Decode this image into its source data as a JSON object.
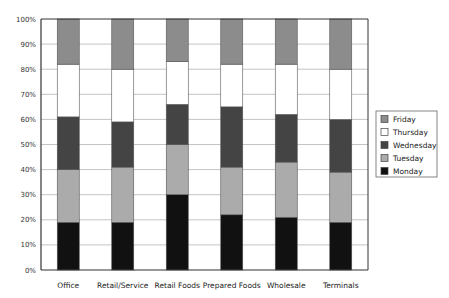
{
  "chart_data": {
    "type": "bar",
    "stacked": true,
    "percent": true,
    "title": "",
    "xlabel": "",
    "ylabel": "",
    "ylim": [
      0,
      100
    ],
    "yticks": [
      "0%",
      "10%",
      "20%",
      "30%",
      "40%",
      "50%",
      "60%",
      "70%",
      "80%",
      "90%",
      "100%"
    ],
    "grid": true,
    "legend_position": "right",
    "categories": [
      "Office",
      "Retail/Service",
      "Retail Foods",
      "Prepared Foods",
      "Wholesale",
      "Terminals"
    ],
    "series": [
      {
        "name": "Monday",
        "color": "#111111",
        "values": [
          19,
          19,
          30,
          22,
          21,
          19
        ]
      },
      {
        "name": "Tuesday",
        "color": "#ababab",
        "values": [
          21,
          22,
          20,
          19,
          22,
          20
        ]
      },
      {
        "name": "Wednesday",
        "color": "#444444",
        "values": [
          21,
          18,
          16,
          24,
          19,
          21
        ]
      },
      {
        "name": "Thursday",
        "color": "#ffffff",
        "values": [
          21,
          21,
          17,
          17,
          20,
          20
        ]
      },
      {
        "name": "Friday",
        "color": "#8c8c8c",
        "values": [
          18,
          20,
          17,
          18,
          18,
          20
        ]
      }
    ],
    "legend_order": [
      "Friday",
      "Thursday",
      "Wednesday",
      "Tuesday",
      "Monday"
    ]
  }
}
